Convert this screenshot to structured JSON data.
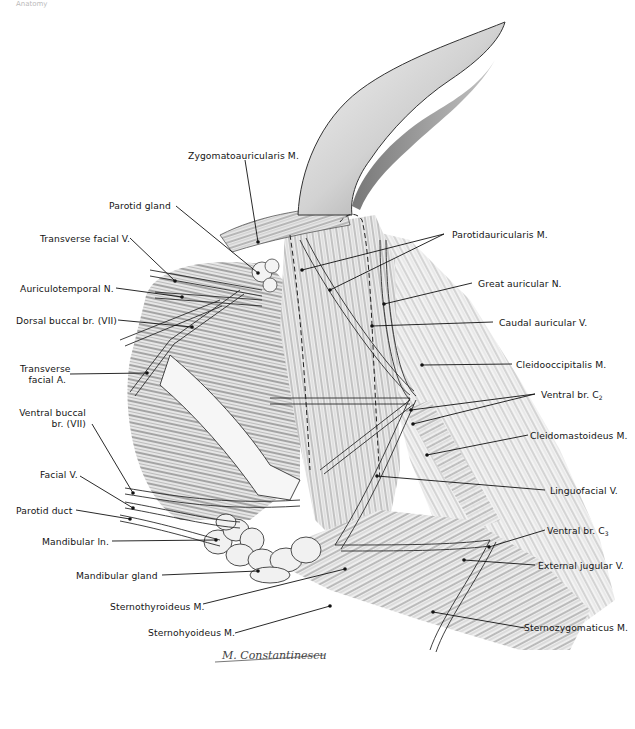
{
  "figure": {
    "corner_text": "Anatomy",
    "signature": "M. Constantinescu",
    "colors": {
      "ink": "#1a1a1a",
      "shade": "#8a8a8a",
      "light": "#e6e6e6",
      "background": "#ffffff"
    },
    "labels": {
      "zygomatoauricularis": "Zygomatoauricularis M.",
      "parotid_gland": "Parotid gland",
      "transverse_facial_v": "Transverse facial V.",
      "auriculotemporal_n": "Auriculotemporal N.",
      "dorsal_buccal": "Dorsal buccal br. (VII)",
      "transverse_facial_a_1": "Transverse",
      "transverse_facial_a_2": "facial A.",
      "ventral_buccal_1": "Ventral buccal",
      "ventral_buccal_2": "br. (VII)",
      "facial_v": "Facial V.",
      "parotid_duct": "Parotid duct",
      "mandibular_ln": "Mandibular ln.",
      "mandibular_gland": "Mandibular gland",
      "sternothyroideus": "Sternothyroideus M.",
      "sternohyoideus": "Sternohyoideus M.",
      "parotidauricularis": "Parotidauricularis M.",
      "great_auricular_n": "Great auricular N.",
      "caudal_auricular_v": "Caudal auricular V.",
      "cleidooccipitalis": "Cleidooccipitalis M.",
      "ventral_br_c2": "Ventral br. C",
      "ventral_br_c2_sub": "2",
      "cleidomastoideus": "Cleidomastoideus M.",
      "linguofacial_v": "Linguofacial V.",
      "ventral_br_c3": "Ventral br. C",
      "ventral_br_c3_sub": "3",
      "external_jugular_v": "External jugular V.",
      "sternozygomaticus": "Sternozygomaticus M."
    }
  }
}
